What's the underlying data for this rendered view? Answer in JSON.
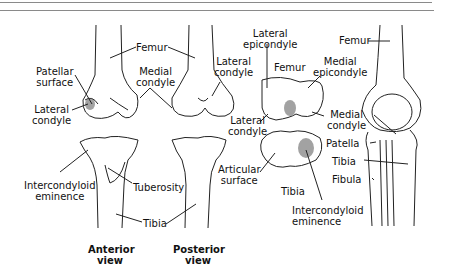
{
  "figure": {
    "views": [
      {
        "id": "anterior",
        "caption_line1": "Anterior",
        "caption_line2": "view"
      },
      {
        "id": "posterior",
        "caption_line1": "Posterior",
        "caption_line2": "view"
      }
    ],
    "labels": {
      "femur_anterior": "Femur",
      "patellar_surface_1": "Patellar",
      "patellar_surface_2": "surface",
      "lateral_condyle_a1": "Lateral",
      "lateral_condyle_a2": "condyle",
      "medial_condyle_a1": "Medial",
      "medial_condyle_a2": "condyle",
      "lateral_condyle_p1": "Lateral",
      "lateral_condyle_p2": "condyle",
      "lateral_condyle_p3_1": "Lateral",
      "lateral_condyle_p3_2": "condyle",
      "intercondyloid_1": "Intercondyloid",
      "intercondyloid_2": "eminence",
      "tuberosity": "Tuberosity",
      "tibia_front": "Tibia",
      "lateral_epicondyle_1": "Lateral",
      "lateral_epicondyle_2": "epicondyle",
      "femur_inferior": "Femur",
      "medial_epicondyle_1": "Medial",
      "medial_epicondyle_2": "epicondyle",
      "medial_condyle_s1": "Medial",
      "medial_condyle_s2": "condyle",
      "articular_surface_1": "Articular",
      "articular_surface_2": "surface",
      "tibia_superior": "Tibia",
      "intercondyloid_s1": "Intercondyloid",
      "intercondyloid_s2": "eminence",
      "femur_lateral": "Femur",
      "patella": "Patella",
      "tibia_lateral": "Tibia",
      "fibula": "Fibula"
    },
    "colors": {
      "ink": "#111111",
      "rule": "#8a8a8a",
      "background": "#ffffff"
    }
  }
}
